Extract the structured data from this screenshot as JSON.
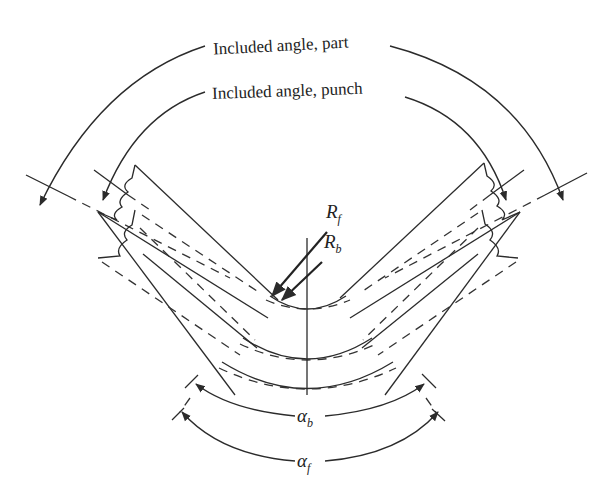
{
  "diagram": {
    "labels": {
      "included_angle_part": "Included angle, part",
      "included_angle_punch": "Included angle, punch",
      "radius_final": {
        "base": "R",
        "sub": "f"
      },
      "radius_bend": {
        "base": "R",
        "sub": "b"
      },
      "angle_bend": {
        "base": "α",
        "sub": "b"
      },
      "angle_final": {
        "base": "α",
        "sub": "f"
      }
    },
    "colors": {
      "background": "#ffffff",
      "line": "#2b2b2b"
    }
  }
}
